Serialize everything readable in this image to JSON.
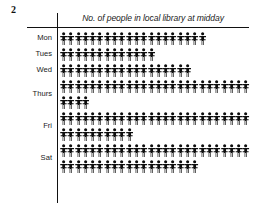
{
  "figure": {
    "number": "2"
  },
  "chart": {
    "title": "No. of people in local library at midday",
    "icon_name": "person-icon",
    "icon_color": "#0d0d0d"
  },
  "chart_data": {
    "type": "bar",
    "title": "No. of people in local library at midday",
    "xlabel": "",
    "ylabel": "",
    "categories": [
      "Mon",
      "Tues",
      "Wed",
      "Thurs",
      "Fri",
      "Sat"
    ],
    "values": [
      20,
      13,
      18,
      30,
      36,
      45
    ],
    "unit": "person symbol = 1 person",
    "rows": [
      {
        "label": "Mon",
        "total": 20,
        "lines": [
          20
        ]
      },
      {
        "label": "Tues",
        "total": 13,
        "lines": [
          13
        ]
      },
      {
        "label": "Wed",
        "total": 18,
        "lines": [
          18
        ]
      },
      {
        "label": "Thurs",
        "total": 30,
        "lines": [
          26,
          4
        ]
      },
      {
        "label": "Fri",
        "total": 36,
        "lines": [
          26,
          10
        ]
      },
      {
        "label": "Sat",
        "total": 45,
        "lines": [
          26,
          19
        ]
      }
    ],
    "legend": [],
    "grid": false
  }
}
